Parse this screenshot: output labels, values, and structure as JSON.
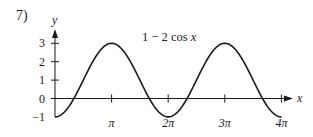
{
  "problem": {
    "number": "7)"
  },
  "chart_data": {
    "type": "line",
    "title": "",
    "function_label": "1 − 2 cos x",
    "function_label_parts": {
      "prefix": "1 − 2 cos ",
      "var": "x"
    },
    "xlabel": "x",
    "ylabel": "y",
    "xlim": [
      0,
      12.566
    ],
    "ylim": [
      -1,
      3
    ],
    "grid": false,
    "legend": "none",
    "x_ticks": [
      3.1416,
      6.2832,
      9.4248,
      12.5664
    ],
    "x_tick_labels": [
      "π",
      "2π",
      "3π",
      "4π"
    ],
    "y_ticks": [
      -1,
      0,
      1,
      2,
      3
    ],
    "y_tick_labels": [
      "−1",
      "0",
      "1",
      "2",
      "3"
    ],
    "series": [
      {
        "name": "1 − 2 cos x",
        "x": [
          0,
          1.5708,
          3.1416,
          4.7124,
          6.2832,
          7.854,
          9.4248,
          10.9956,
          12.5664
        ],
        "values": [
          -1,
          1,
          3,
          1,
          -1,
          1,
          3,
          1,
          -1
        ]
      }
    ],
    "color": "#1a1a1a"
  }
}
